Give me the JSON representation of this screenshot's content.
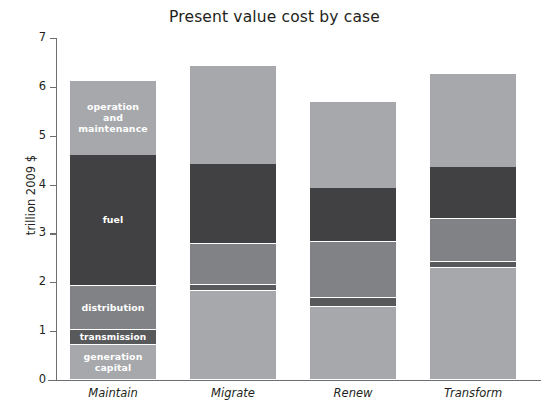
{
  "chart_data": {
    "type": "bar",
    "subtype": "stacked-bar",
    "title": "Present value cost by case",
    "xlabel": "",
    "ylabel": "trillion 2009 $",
    "ylim": [
      0,
      7
    ],
    "yticks": [
      0,
      1,
      2,
      3,
      4,
      5,
      6,
      7
    ],
    "grid": false,
    "legend": "in-bar labels",
    "categories": [
      "Maintain",
      "Migrate",
      "Renew",
      "Transform"
    ],
    "series": [
      {
        "name": "generation capital",
        "label": "generation\ncapital",
        "color": "#a6a8ab",
        "values": [
          0.72,
          1.82,
          1.5,
          2.3
        ]
      },
      {
        "name": "transmission",
        "label": "transmission",
        "color": "#58595b",
        "values": [
          0.3,
          0.12,
          0.17,
          0.12
        ]
      },
      {
        "name": "distribution",
        "label": "distribution",
        "color": "#808285",
        "values": [
          0.91,
          0.84,
          1.15,
          0.87
        ]
      },
      {
        "name": "fuel",
        "label": "fuel",
        "color": "#414042",
        "values": [
          2.67,
          1.65,
          1.1,
          1.07
        ]
      },
      {
        "name": "operation and maintenance",
        "label": "operation\nand\nmaintenance",
        "color": "#a6a8ab",
        "values": [
          1.53,
          2.0,
          1.78,
          1.9
        ]
      }
    ],
    "totals": [
      6.13,
      6.43,
      5.7,
      6.26
    ],
    "segment_boundaries_trillion": {
      "Maintain": [
        0,
        0.72,
        1.02,
        1.93,
        4.6,
        6.13
      ],
      "Migrate": [
        0,
        1.82,
        1.94,
        2.78,
        4.43,
        6.43
      ],
      "Renew": [
        0,
        1.5,
        1.67,
        2.82,
        3.92,
        5.7
      ],
      "Transform": [
        0,
        2.3,
        2.42,
        3.29,
        4.36,
        6.26
      ]
    },
    "labeled_bar": "Maintain"
  }
}
